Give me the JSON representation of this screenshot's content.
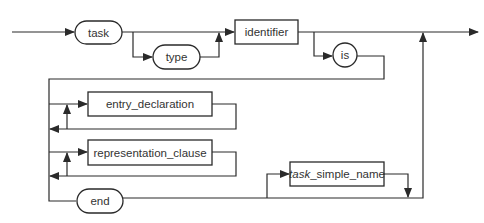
{
  "diagram": {
    "type": "syntax-railroad-diagram",
    "nodes": {
      "task": {
        "label": "task",
        "kind": "keyword"
      },
      "type": {
        "label": "type",
        "kind": "keyword"
      },
      "identifier": {
        "label": "identifier",
        "kind": "nonterminal"
      },
      "is": {
        "label": "is",
        "kind": "keyword"
      },
      "entry_declaration": {
        "label": "entry_declaration",
        "kind": "nonterminal"
      },
      "representation_clause": {
        "label": "representation_clause",
        "kind": "nonterminal"
      },
      "end": {
        "label": "end",
        "kind": "keyword"
      },
      "task_simple_name": {
        "prefix": "task",
        "suffix": "_simple_name",
        "kind": "nonterminal"
      }
    },
    "colors": {
      "line": "#2a2a2a",
      "text": "#333333",
      "background": "#ffffff"
    }
  }
}
